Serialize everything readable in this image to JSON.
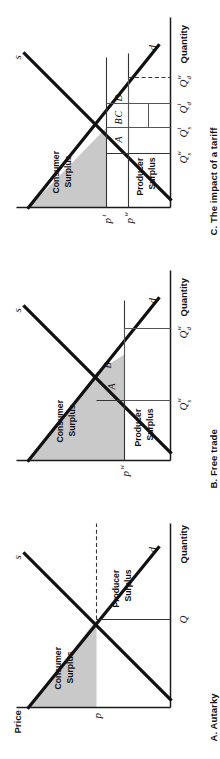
{
  "figure": {
    "orientation": "rotated-90-ccw",
    "axis_labels": {
      "price": "Price",
      "quantity": "Quantity"
    },
    "curve_labels": {
      "supply": "s",
      "demand": "d"
    },
    "surplus_labels": {
      "consumer_line1": "Consumer",
      "consumer_line2": "Surplus",
      "producer_line1": "Producer",
      "producer_line2": "Surplus"
    },
    "colors": {
      "shading": "#c9c9c9",
      "curve": "#111111",
      "axis": "#1a1a1a",
      "background": "#ffffff"
    }
  },
  "panels": [
    {
      "id": "a",
      "caption": "A. Autarky",
      "axis_price": "Price",
      "axis_quantity": "Quantity",
      "supply": "s",
      "demand": "d",
      "price_labels": [
        {
          "base": "p",
          "sup": ""
        }
      ],
      "quantity_labels": [
        {
          "base": "Q",
          "sub": "",
          "sup": ""
        }
      ],
      "regions": [],
      "consumer_surplus": {
        "line1": "Consumer",
        "line2": "Surplus",
        "shaded": true
      },
      "producer_surplus": {
        "line1": "Producer",
        "line2": "Surplus",
        "shaded": false
      }
    },
    {
      "id": "b",
      "caption": "B. Free trade",
      "axis_quantity": "Quantity",
      "supply": "s",
      "demand": "d",
      "price_labels": [
        {
          "base": "p",
          "sup": "w"
        }
      ],
      "quantity_labels": [
        {
          "base": "Q",
          "sub": "s",
          "sup": "w"
        },
        {
          "base": "Q",
          "sub": "d",
          "sup": "w"
        }
      ],
      "regions": [
        {
          "label": "A",
          "shaded": true
        },
        {
          "label": "B",
          "shaded": true
        }
      ],
      "consumer_surplus": {
        "line1": "Consumer",
        "line2": "Surplus",
        "shaded": true
      },
      "producer_surplus": {
        "line1": "Producer",
        "line2": "Surplus",
        "shaded": false
      }
    },
    {
      "id": "c",
      "caption": "C. The impact of a tariff",
      "axis_quantity": "Quantity",
      "supply": "s",
      "demand": "d",
      "price_labels": [
        {
          "base": "p",
          "sup": "t"
        },
        {
          "base": "p",
          "sup": "w"
        }
      ],
      "quantity_labels": [
        {
          "base": "Q",
          "sub": "s",
          "sup": "w"
        },
        {
          "base": "Q",
          "sub": "s",
          "sup": "t"
        },
        {
          "base": "Q",
          "sub": "d",
          "sup": "t"
        },
        {
          "base": "Q",
          "sub": "d",
          "sup": "w"
        }
      ],
      "regions": [
        {
          "label": "A",
          "shaded": false
        },
        {
          "label": "B",
          "shaded": false
        },
        {
          "label": "C",
          "shaded": false
        },
        {
          "label": "D",
          "shaded": false
        }
      ],
      "consumer_surplus": {
        "line1": "Consumer",
        "line2": "Surplus",
        "shaded": true
      },
      "producer_surplus": {
        "line1": "Producer",
        "line2": "Surplus",
        "shaded": false
      }
    }
  ]
}
